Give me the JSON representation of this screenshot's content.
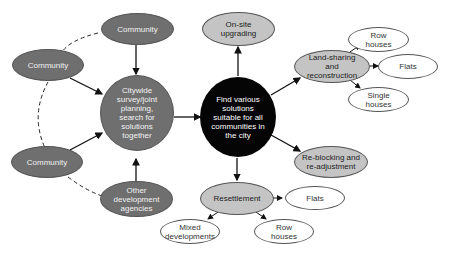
{
  "diagram": {
    "nodes": {
      "community_top": "Community",
      "community_left": "Community",
      "community_bottom": "Community",
      "citywide": "Citywide survey/joint planning, search for solutions together",
      "other_agencies": "Other development agencies",
      "find_solutions": "Find various solutions suitable for all communities in the city",
      "onsite": "On-site upgrading",
      "landsharing": "Land-sharing and reconstruction",
      "ls_row": "Row houses",
      "ls_flats": "Flats",
      "ls_single": "Single houses",
      "reblocking": "Re-blocking and re-adjustment",
      "resettlement": "Resettlement",
      "rs_flats": "Flats",
      "rs_mixed": "Mixed developments",
      "rs_row": "Row houses"
    },
    "colors": {
      "community": "#6f6f6f",
      "center": "#050505",
      "option": "#c4c4c4",
      "leaf": "#ffffff"
    }
  }
}
